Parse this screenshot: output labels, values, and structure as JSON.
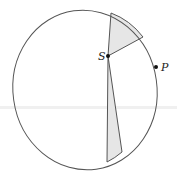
{
  "diagram": {
    "colors": {
      "stroke": "#555555",
      "sector_fill": "#e6e6e6",
      "point": "#111111",
      "background": "#ffffff"
    },
    "orbit": {
      "shape": "ellipse",
      "cx": 85,
      "cy": 90,
      "rx": 72,
      "ry": 80,
      "rotate_deg": -8
    },
    "points": [
      {
        "id": "S",
        "label": "S",
        "x": 108,
        "y": 56,
        "role": "focus"
      },
      {
        "id": "P",
        "label": "P",
        "x": 156,
        "y": 67,
        "role": "orbit-point"
      }
    ],
    "sectors": [
      {
        "name": "upper-sector",
        "from": [
          111,
          13
        ],
        "to": [
          143,
          37
        ]
      },
      {
        "name": "lower-sector",
        "from": [
          107,
          162
        ],
        "to": [
          122,
          152
        ]
      }
    ]
  }
}
